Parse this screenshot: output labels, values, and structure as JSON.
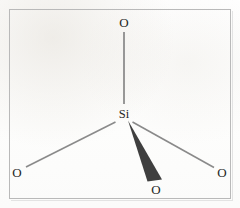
{
  "figure": {
    "kind": "chemical-structure-diagram",
    "frame": {
      "border_color": "#b9b9b9",
      "background_color": "#fefefe"
    },
    "bond_color": "#8d8d8d",
    "wedge_color": "#3c3c3c",
    "label_color": "#262626"
  },
  "atoms": {
    "center": {
      "id": "si-center",
      "label": "Si",
      "x": 124,
      "y": 114
    },
    "oxygens": [
      {
        "id": "o-top",
        "label": "O",
        "x": 124,
        "y": 22,
        "position": "top"
      },
      {
        "id": "o-bottom-left",
        "label": "O",
        "x": 17,
        "y": 172,
        "position": "bottom-left"
      },
      {
        "id": "o-bottom-right",
        "label": "O",
        "x": 222,
        "y": 172,
        "position": "bottom-right"
      },
      {
        "id": "o-front",
        "label": "O",
        "x": 156,
        "y": 189,
        "position": "bottom-center-front"
      }
    ]
  },
  "bonds": [
    {
      "id": "bond-si-o-top",
      "style": "line",
      "from": "si-center",
      "to": "o-top",
      "x1": 124,
      "y1": 32,
      "x2": 124,
      "y2": 104
    },
    {
      "id": "bond-si-o-bottom-left",
      "style": "line",
      "from": "si-center",
      "to": "o-bottom-left",
      "x1": 115,
      "y1": 122,
      "x2": 26,
      "y2": 167
    },
    {
      "id": "bond-si-o-bottom-right",
      "style": "line",
      "from": "si-center",
      "to": "o-bottom-right",
      "x1": 133,
      "y1": 122,
      "x2": 214,
      "y2": 167
    },
    {
      "id": "bond-si-o-front",
      "style": "wedge",
      "from": "si-center",
      "to": "o-front",
      "apex_x": 128,
      "apex_y": 121,
      "base_left_x": 147,
      "base_left_y": 181,
      "base_right_x": 162,
      "base_right_y": 180
    }
  ]
}
